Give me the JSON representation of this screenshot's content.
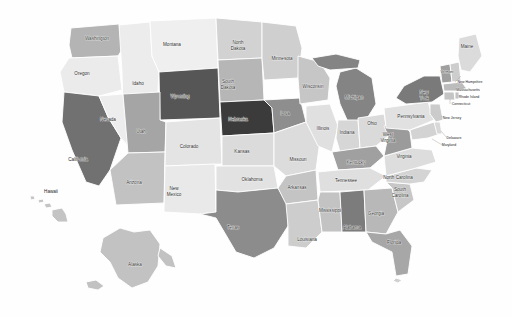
{
  "figure": {
    "type": "choropleth-map",
    "region": "United States",
    "background_color": "#fefefe",
    "border_color": "#ffffff",
    "palette": {
      "darkest": "#3a3a3a",
      "dark": "#555555",
      "medium_dark": "#777777",
      "medium": "#8f8f8f",
      "medium_light": "#aeaeae",
      "light": "#c9c9c9",
      "lighter": "#dedede",
      "lightest": "#efefef"
    }
  },
  "chart_data": {
    "type": "heatmap",
    "title": "",
    "xlabel": "",
    "ylabel": "",
    "legend": "none",
    "grid": false,
    "categories": [
      "Washington",
      "Oregon",
      "California",
      "Nevada",
      "Idaho",
      "Montana",
      "Wyoming",
      "Utah",
      "Arizona",
      "Colorado",
      "New Mexico",
      "North Dakota",
      "South Dakota",
      "Nebraska",
      "Kansas",
      "Oklahoma",
      "Texas",
      "Minnesota",
      "Iowa",
      "Missouri",
      "Arkansas",
      "Louisiana",
      "Wisconsin",
      "Illinois",
      "Michigan",
      "Indiana",
      "Ohio",
      "Kentucky",
      "Tennessee",
      "Mississippi",
      "Alabama",
      "Georgia",
      "Florida",
      "South Carolina",
      "North Carolina",
      "Virginia",
      "West Virginia",
      "Maryland",
      "Delaware",
      "Pennsylvania",
      "New Jersey",
      "New York",
      "Connecticut",
      "Rhode Island",
      "Massachusetts",
      "Vermont",
      "New Hampshire",
      "Maine",
      "Alaska",
      "Hawaii"
    ],
    "values": [
      0.55,
      0.22,
      0.76,
      0.2,
      0.2,
      0.18,
      0.82,
      0.62,
      0.46,
      0.22,
      0.2,
      0.34,
      0.48,
      0.95,
      0.3,
      0.24,
      0.68,
      0.36,
      0.66,
      0.3,
      0.44,
      0.36,
      0.4,
      0.26,
      0.7,
      0.34,
      0.3,
      0.58,
      0.28,
      0.44,
      0.72,
      0.5,
      0.58,
      0.42,
      0.38,
      0.32,
      0.6,
      0.36,
      0.3,
      0.26,
      0.4,
      0.74,
      0.44,
      0.44,
      0.5,
      0.64,
      0.36,
      0.3,
      0.44,
      0.44
    ]
  },
  "states": [
    {
      "name": "Washington",
      "code": "WA",
      "label": "Washington",
      "label_lines": [
        "Washington"
      ],
      "fill": "#b4b4b4",
      "lx": 97,
      "ly": 39,
      "size": "lbl-sm"
    },
    {
      "name": "Oregon",
      "code": "OR",
      "label": "Oregon",
      "label_lines": [
        "Oregon"
      ],
      "fill": "#ebebeb",
      "lx": 82,
      "ly": 74,
      "size": "lbl-sm"
    },
    {
      "name": "California",
      "code": "CA",
      "label": "California",
      "label_lines": [
        "California"
      ],
      "fill": "#717171",
      "lx": 78,
      "ly": 160,
      "size": "lbl-sm"
    },
    {
      "name": "Nevada",
      "code": "NV",
      "label": "Nevada",
      "label_lines": [
        "Nevada"
      ],
      "fill": "#ededed",
      "lx": 108,
      "ly": 120,
      "size": "lbl-sm"
    },
    {
      "name": "Idaho",
      "code": "ID",
      "label": "Idaho",
      "label_lines": [
        "Idaho"
      ],
      "fill": "#ececec",
      "lx": 138,
      "ly": 84,
      "size": "lbl-sm"
    },
    {
      "name": "Montana",
      "code": "MT",
      "label": "Montana",
      "label_lines": [
        "Montana"
      ],
      "fill": "#efefef",
      "lx": 172,
      "ly": 45,
      "size": "lbl-sm"
    },
    {
      "name": "Wyoming",
      "code": "WY",
      "label": "Wyoming",
      "label_lines": [
        "Wyoming"
      ],
      "fill": "#565656",
      "lx": 180,
      "ly": 97,
      "size": "lbl-sm"
    },
    {
      "name": "Utah",
      "code": "UT",
      "label": "Utah",
      "label_lines": [
        "Utah"
      ],
      "fill": "#a5a5a5",
      "lx": 141,
      "ly": 132,
      "size": "lbl-sm"
    },
    {
      "name": "Arizona",
      "code": "AZ",
      "label": "Arizona",
      "label_lines": [
        "Arizona"
      ],
      "fill": "#c2c2c2",
      "lx": 134,
      "ly": 183,
      "size": "lbl-sm"
    },
    {
      "name": "Colorado",
      "code": "CO",
      "label": "Colorado",
      "label_lines": [
        "Colorado"
      ],
      "fill": "#e4e4e4",
      "lx": 189,
      "ly": 147,
      "size": "lbl-sm"
    },
    {
      "name": "New Mexico",
      "code": "NM",
      "label": "New Mexico",
      "label_lines": [
        "New",
        "Mexico"
      ],
      "fill": "#e9e9e9",
      "lx": 174,
      "ly": 192,
      "size": "lbl-sm"
    },
    {
      "name": "North Dakota",
      "code": "ND",
      "label": "North Dakota",
      "label_lines": [
        "North",
        "Dakota"
      ],
      "fill": "#d2d2d2",
      "lx": 238,
      "ly": 46,
      "size": "lbl-sm"
    },
    {
      "name": "South Dakota",
      "code": "SD",
      "label": "South Dakota",
      "label_lines": [
        "South",
        "Dakota"
      ],
      "fill": "#b6b6b6",
      "lx": 228,
      "ly": 85,
      "size": "lbl-sm"
    },
    {
      "name": "Nebraska",
      "code": "NE",
      "label": "Nebraska",
      "label_lines": [
        "Nebraska"
      ],
      "fill": "#3b3b3b",
      "lx": 238,
      "ly": 120,
      "size": "lbl-sm"
    },
    {
      "name": "Kansas",
      "code": "KS",
      "label": "Kansas",
      "label_lines": [
        "Kansas"
      ],
      "fill": "#dbdbdb",
      "lx": 242,
      "ly": 152,
      "size": "lbl-sm"
    },
    {
      "name": "Oklahoma",
      "code": "OK",
      "label": "Oklahoma",
      "label_lines": [
        "Oklahoma"
      ],
      "fill": "#e2e2e2",
      "lx": 252,
      "ly": 180,
      "size": "lbl-sm"
    },
    {
      "name": "Texas",
      "code": "TX",
      "label": "Texas",
      "label_lines": [
        "Texas"
      ],
      "fill": "#8c8c8c",
      "lx": 233,
      "ly": 228,
      "size": "lbl-sm"
    },
    {
      "name": "Minnesota",
      "code": "MN",
      "label": "Minnesota",
      "label_lines": [
        "Minnesota"
      ],
      "fill": "#cfcfcf",
      "lx": 282,
      "ly": 59,
      "size": "lbl-sm"
    },
    {
      "name": "Iowa",
      "code": "IA",
      "label": "Iowa",
      "label_lines": [
        "Iowa"
      ],
      "fill": "#8e8e8e",
      "lx": 285,
      "ly": 114,
      "size": "lbl-sm"
    },
    {
      "name": "Missouri",
      "code": "MO",
      "label": "Missouri",
      "label_lines": [
        "Missouri"
      ],
      "fill": "#dcdcdc",
      "lx": 298,
      "ly": 160,
      "size": "lbl-sm"
    },
    {
      "name": "Arkansas",
      "code": "AR",
      "label": "Arkansas",
      "label_lines": [
        "Arkansas"
      ],
      "fill": "#c4c4c4",
      "lx": 297,
      "ly": 188,
      "size": "lbl-sm"
    },
    {
      "name": "Louisiana",
      "code": "LA",
      "label": "Louisiana",
      "label_lines": [
        "Louisiana"
      ],
      "fill": "#cdcdcd",
      "lx": 307,
      "ly": 240,
      "size": "lbl-sm"
    },
    {
      "name": "Wisconsin",
      "code": "WI",
      "label": "Wisconsin",
      "label_lines": [
        "Wisconsin"
      ],
      "fill": "#c6c6c6",
      "lx": 313,
      "ly": 87,
      "size": "lbl-sm"
    },
    {
      "name": "Illinois",
      "code": "IL",
      "label": "Illinois",
      "label_lines": [
        "Illinois"
      ],
      "fill": "#e0e0e0",
      "lx": 323,
      "ly": 129,
      "size": "lbl-sm"
    },
    {
      "name": "Michigan",
      "code": "MI",
      "label": "Michigan",
      "label_lines": [
        "Michigan"
      ],
      "fill": "#848484",
      "lx": 354,
      "ly": 98,
      "size": "lbl-sm"
    },
    {
      "name": "Indiana",
      "code": "IN",
      "label": "Indiana",
      "label_lines": [
        "Indiana"
      ],
      "fill": "#d6d6d6",
      "lx": 347,
      "ly": 133,
      "size": "lbl-sm"
    },
    {
      "name": "Ohio",
      "code": "OH",
      "label": "Ohio",
      "label_lines": [
        "Ohio"
      ],
      "fill": "#dadada",
      "lx": 372,
      "ly": 124,
      "size": "lbl-sm"
    },
    {
      "name": "Kentucky",
      "code": "KY",
      "label": "Kentucky",
      "label_lines": [
        "Kentucky"
      ],
      "fill": "#a0a0a0",
      "lx": 356,
      "ly": 163,
      "size": "lbl-sm"
    },
    {
      "name": "Tennessee",
      "code": "TN",
      "label": "Tennessee",
      "label_lines": [
        "Tennessee"
      ],
      "fill": "#dfdfdf",
      "lx": 346,
      "ly": 181,
      "size": "lbl-sm"
    },
    {
      "name": "Mississippi",
      "code": "MS",
      "label": "Mississippi",
      "label_lines": [
        "Mississippi"
      ],
      "fill": "#c3c3c3",
      "lx": 330,
      "ly": 211,
      "size": "lbl-sm"
    },
    {
      "name": "Alabama",
      "code": "AL",
      "label": "Alabama",
      "label_lines": [
        "Alabama"
      ],
      "fill": "#7c7c7c",
      "lx": 352,
      "ly": 228,
      "size": "lbl-sm"
    },
    {
      "name": "Georgia",
      "code": "GA",
      "label": "Georgia",
      "label_lines": [
        "Georgia"
      ],
      "fill": "#b8b8b8",
      "lx": 376,
      "ly": 214,
      "size": "lbl-sm"
    },
    {
      "name": "Florida",
      "code": "FL",
      "label": "Florida",
      "label_lines": [
        "Florida"
      ],
      "fill": "#a7a7a7",
      "lx": 394,
      "ly": 243,
      "size": "lbl-sm"
    },
    {
      "name": "South Carolina",
      "code": "SC",
      "label": "South Carolina",
      "label_lines": [
        "South",
        "Carolina"
      ],
      "fill": "#c7c7c7",
      "lx": 400,
      "ly": 193,
      "size": "lbl-sm"
    },
    {
      "name": "North Carolina",
      "code": "NC",
      "label": "North Carolina",
      "label_lines": [
        "North Carolina"
      ],
      "fill": "#d4d4d4",
      "lx": 398,
      "ly": 178,
      "size": "lbl-sm"
    },
    {
      "name": "Virginia",
      "code": "VA",
      "label": "Virginia",
      "label_lines": [
        "Virginia"
      ],
      "fill": "#dddddd",
      "lx": 404,
      "ly": 157,
      "size": "lbl-sm"
    },
    {
      "name": "West Virginia",
      "code": "WV",
      "label": "West Virginia",
      "label_lines": [
        "West",
        "Virginia"
      ],
      "fill": "#9b9b9b",
      "lx": 388,
      "ly": 138,
      "size": "lbl-sm"
    },
    {
      "name": "Maryland",
      "code": "MD",
      "label": "Maryland",
      "label_lines": [
        "Maryland"
      ],
      "fill": "#d3d3d3",
      "lx": 449,
      "ly": 145,
      "size": "lbl-xs"
    },
    {
      "name": "Delaware",
      "code": "DE",
      "label": "Delaware",
      "label_lines": [
        "Delaware"
      ],
      "fill": "#d8d8d8",
      "lx": 454,
      "ly": 138,
      "size": "lbl-xs"
    },
    {
      "name": "Pennsylvania",
      "code": "PA",
      "label": "Pennsylvania",
      "label_lines": [
        "Pennsylvania"
      ],
      "fill": "#e1e1e1",
      "lx": 411,
      "ly": 117,
      "size": "lbl-sm"
    },
    {
      "name": "New Jersey",
      "code": "NJ",
      "label": "New Jersey",
      "label_lines": [
        "New Jersey"
      ],
      "fill": "#cbcbcb",
      "lx": 452,
      "ly": 118,
      "size": "lbl-xs"
    },
    {
      "name": "New York",
      "code": "NY",
      "label": "New York",
      "label_lines": [
        "New",
        "York"
      ],
      "fill": "#7a7a7a",
      "lx": 424,
      "ly": 96,
      "size": "lbl-sm"
    },
    {
      "name": "Connecticut",
      "code": "CT",
      "label": "Connecticut",
      "label_lines": [
        "Connecticut"
      ],
      "fill": "#c4c4c4",
      "lx": 461,
      "ly": 104,
      "size": "lbl-xs"
    },
    {
      "name": "Rhode Island",
      "code": "RI",
      "label": "Rhode Island",
      "label_lines": [
        "Rhode Island"
      ],
      "fill": "#c2c2c2",
      "lx": 469,
      "ly": 97,
      "size": "lbl-xs"
    },
    {
      "name": "Massachusetts",
      "code": "MA",
      "label": "Massachusetts",
      "label_lines": [
        "Massachusetts"
      ],
      "fill": "#bcbcbc",
      "lx": 468,
      "ly": 90,
      "size": "lbl-xs"
    },
    {
      "name": "Vermont",
      "code": "VT",
      "label": "Vermont",
      "label_lines": [
        "Vermont"
      ],
      "fill": "#9f9f9f",
      "lx": 447,
      "ly": 72,
      "size": "lbl-xs"
    },
    {
      "name": "New Hampshire",
      "code": "NH",
      "label": "New Hampshire",
      "label_lines": [
        "New Hampshire"
      ],
      "fill": "#cdcdcd",
      "lx": 470,
      "ly": 82,
      "size": "lbl-xs"
    },
    {
      "name": "Maine",
      "code": "ME",
      "label": "Maine",
      "label_lines": [
        "Maine"
      ],
      "fill": "#dbdbdb",
      "lx": 467,
      "ly": 47,
      "size": "lbl-sm"
    },
    {
      "name": "Alaska",
      "code": "AK",
      "label": "Alaska",
      "label_lines": [
        "Alaska"
      ],
      "fill": "#c2c2c2",
      "lx": 135,
      "ly": 265,
      "size": "lbl-sm"
    },
    {
      "name": "Hawaii",
      "code": "HI",
      "label": "Hawaii",
      "label_lines": [
        "Hawaii",
        ""
      ],
      "fill": "#c4c4c4",
      "lx": 51,
      "ly": 192,
      "size": "lbl-sm"
    }
  ]
}
